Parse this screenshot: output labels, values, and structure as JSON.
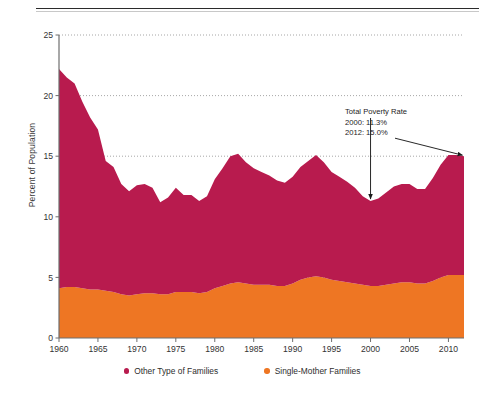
{
  "chart_data": {
    "type": "area",
    "stacked": true,
    "title": "",
    "xlabel": "",
    "ylabel": "Percent of Population",
    "xlim": [
      1960,
      2012
    ],
    "ylim": [
      0,
      25
    ],
    "ytick_values": [
      0,
      5,
      10,
      15,
      20,
      25
    ],
    "ytick_labels": [
      "0",
      "5",
      "10",
      "15",
      "20",
      "25"
    ],
    "xtick_values": [
      1960,
      1965,
      1970,
      1975,
      1980,
      1985,
      1990,
      1995,
      2000,
      2005,
      2010
    ],
    "xtick_labels": [
      "1960",
      "1965",
      "1970",
      "1975",
      "1980",
      "1985",
      "1990",
      "1995",
      "2000",
      "2005",
      "2010"
    ],
    "grid": "horizontal-dotted",
    "legend_position": "bottom-center",
    "x": [
      1960,
      1961,
      1962,
      1963,
      1964,
      1965,
      1966,
      1967,
      1968,
      1969,
      1970,
      1971,
      1972,
      1973,
      1974,
      1975,
      1976,
      1977,
      1978,
      1979,
      1980,
      1981,
      1982,
      1983,
      1984,
      1985,
      1986,
      1987,
      1988,
      1989,
      1990,
      1991,
      1992,
      1993,
      1994,
      1995,
      1996,
      1997,
      1998,
      1999,
      2000,
      2001,
      2002,
      2003,
      2004,
      2005,
      2006,
      2007,
      2008,
      2009,
      2010,
      2011,
      2012
    ],
    "series": [
      {
        "name": "Single-Mother Families",
        "color": "#ee7623",
        "values": [
          4.1,
          4.2,
          4.2,
          4.1,
          4.0,
          4.0,
          3.9,
          3.8,
          3.6,
          3.5,
          3.6,
          3.7,
          3.7,
          3.6,
          3.6,
          3.8,
          3.8,
          3.8,
          3.7,
          3.8,
          4.1,
          4.3,
          4.5,
          4.6,
          4.5,
          4.4,
          4.4,
          4.4,
          4.3,
          4.3,
          4.5,
          4.8,
          5.0,
          5.1,
          5.0,
          4.8,
          4.7,
          4.6,
          4.5,
          4.4,
          4.3,
          4.3,
          4.4,
          4.5,
          4.6,
          4.6,
          4.5,
          4.5,
          4.7,
          5.0,
          5.2,
          5.2,
          5.2
        ]
      },
      {
        "name": "Other Type of Families",
        "color": "#b81b4e",
        "values": [
          18.1,
          17.3,
          16.8,
          15.4,
          14.2,
          13.2,
          10.7,
          10.3,
          9.1,
          8.6,
          9.0,
          9.0,
          8.7,
          7.6,
          8.0,
          8.6,
          8.0,
          8.0,
          7.6,
          7.9,
          9.0,
          9.7,
          10.5,
          10.6,
          10.0,
          9.6,
          9.3,
          9.0,
          8.7,
          8.5,
          8.8,
          9.3,
          9.6,
          10.0,
          9.5,
          8.9,
          8.6,
          8.3,
          7.9,
          7.3,
          7.0,
          7.2,
          7.6,
          8.0,
          8.1,
          8.1,
          7.8,
          7.8,
          8.5,
          9.3,
          9.9,
          9.9,
          9.8
        ]
      }
    ],
    "total_series": {
      "name": "Total Poverty Rate",
      "values": [
        22.2,
        21.5,
        21.0,
        19.5,
        18.2,
        17.2,
        14.6,
        14.1,
        12.7,
        12.1,
        12.6,
        12.7,
        12.4,
        11.2,
        11.6,
        12.4,
        11.8,
        11.8,
        11.3,
        11.7,
        13.1,
        14.0,
        15.0,
        15.2,
        14.5,
        14.0,
        13.7,
        13.4,
        13.0,
        12.8,
        13.3,
        14.1,
        14.6,
        15.1,
        14.5,
        13.7,
        13.3,
        12.9,
        12.4,
        11.7,
        11.3,
        11.5,
        12.0,
        12.5,
        12.7,
        12.7,
        12.3,
        12.3,
        13.2,
        14.3,
        15.1,
        15.1,
        15.0
      ]
    },
    "annotations": [
      {
        "name": "total-poverty-rate-callout",
        "lines": [
          "Total Poverty Rate",
          "2000: 11.3%",
          "2012: 15.0%"
        ],
        "arrows": [
          {
            "name": "arrow-to-2000",
            "target_year": 2000,
            "target_value": 11.3,
            "style": "vertical"
          },
          {
            "name": "arrow-to-2012",
            "target_year": 2012,
            "target_value": 15.0,
            "style": "diagonal"
          }
        ]
      }
    ]
  },
  "legend": {
    "items": [
      {
        "label": "Other Type of Families",
        "color": "#b81b4e"
      },
      {
        "label": "Single-Mother Families",
        "color": "#ee7623"
      }
    ]
  },
  "axis": {
    "y_title": "Percent of Population"
  }
}
